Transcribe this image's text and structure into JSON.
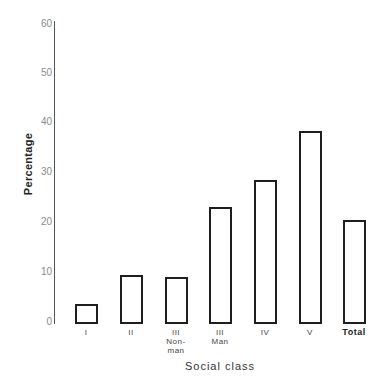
{
  "chart_data": {
    "type": "bar",
    "title": "",
    "xlabel": "Social class",
    "ylabel": "Percentage",
    "ylim": [
      0,
      60
    ],
    "yticks": [
      0,
      10,
      20,
      30,
      40,
      50,
      60
    ],
    "grid": false,
    "legend": null,
    "categories": [
      "I",
      "II",
      "III Non-man",
      "III Man",
      "IV",
      "V",
      "Total"
    ],
    "category_labels": [
      {
        "line1": "I",
        "line2": ""
      },
      {
        "line1": "II",
        "line2": ""
      },
      {
        "line1": "III",
        "line2": "Non-",
        "line3": "man"
      },
      {
        "line1": "III",
        "line2": "Man"
      },
      {
        "line1": "IV",
        "line2": ""
      },
      {
        "line1": "V",
        "line2": ""
      },
      {
        "line1": "Total",
        "line2": ""
      }
    ],
    "values": [
      4,
      9.7,
      9.3,
      23.3,
      28.6,
      38.4,
      20.7
    ]
  },
  "axis": {
    "ytick_labels": [
      "0",
      "10",
      "20",
      "30",
      "40",
      "50",
      "60"
    ]
  },
  "colors": {
    "bar_fill": "#ffffff",
    "bar_stroke": "#1e1e1e",
    "axis": "#555555",
    "tick_text": "#8a8a8a"
  }
}
